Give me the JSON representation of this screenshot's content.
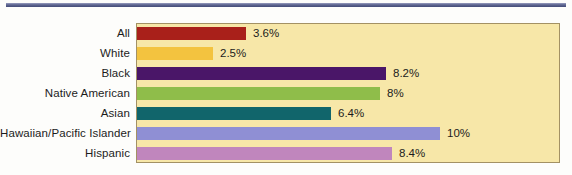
{
  "figure": {
    "background_color": "#fdfdfb",
    "plot_background_color": "#f7e7a8",
    "plot_border_color": "#a39164",
    "top_rule_color": "#5e6691"
  },
  "chart_data": {
    "type": "bar",
    "orientation": "horizontal",
    "title": "",
    "subtitle": "",
    "xlabel": "",
    "ylabel": "",
    "grid": false,
    "legend": "none",
    "xlim": [
      0,
      12
    ],
    "categories": [
      "All",
      "White",
      "Black",
      "Native American",
      "Asian",
      "Hawaiian/Pacific Islander",
      "Hispanic"
    ],
    "values": [
      3.6,
      2.5,
      8.2,
      8,
      6.4,
      10,
      8.4
    ],
    "value_labels": [
      "3.6%",
      "2.5%",
      "8.2%",
      "8%",
      "6.4%",
      "10%",
      "8.4%"
    ],
    "bar_colors": [
      "#a9201a",
      "#f3c33f",
      "#4a1668",
      "#8fbd4a",
      "#11656b",
      "#8f8fd4",
      "#c086bd"
    ]
  }
}
